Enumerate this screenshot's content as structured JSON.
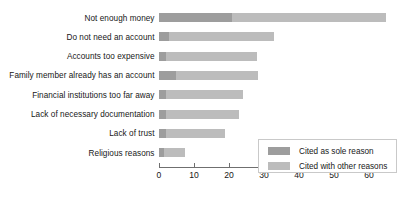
{
  "chart_data": {
    "type": "bar",
    "orientation": "horizontal",
    "stacked": true,
    "title": "",
    "subtitle": "",
    "xlabel": "",
    "ylabel": "",
    "xlim": [
      0,
      65
    ],
    "grid": false,
    "legend_position": "inside-bottom-right",
    "xticks": [
      0,
      10,
      20,
      30,
      40,
      50,
      60
    ],
    "xtick_labels": [
      "0",
      "10",
      "20",
      "30",
      "40",
      "50",
      "60"
    ],
    "categories": [
      "Not enough money",
      "Do not need an account",
      "Accounts too expensive",
      "Family member already has an account",
      "Financial institutions too far away",
      "Lack of necessary documentation",
      "Lack of trust",
      "Religious reasons"
    ],
    "series": [
      {
        "name": "Cited as sole reason",
        "color": "#9d9d9d",
        "values": [
          21,
          3,
          2,
          5,
          2,
          2,
          2,
          1.5
        ]
      },
      {
        "name": "Cited with other reasons",
        "color": "#bcbcbc",
        "values": [
          44,
          30,
          26,
          23.5,
          22,
          21,
          17,
          6
        ]
      }
    ],
    "totals": [
      65,
      33,
      28,
      28.5,
      24,
      23,
      19,
      7.5
    ]
  },
  "legend": {
    "items": [
      {
        "label": "Cited as sole reason",
        "color": "#9d9d9d"
      },
      {
        "label": "Cited with other reasons",
        "color": "#bcbcbc"
      }
    ]
  }
}
